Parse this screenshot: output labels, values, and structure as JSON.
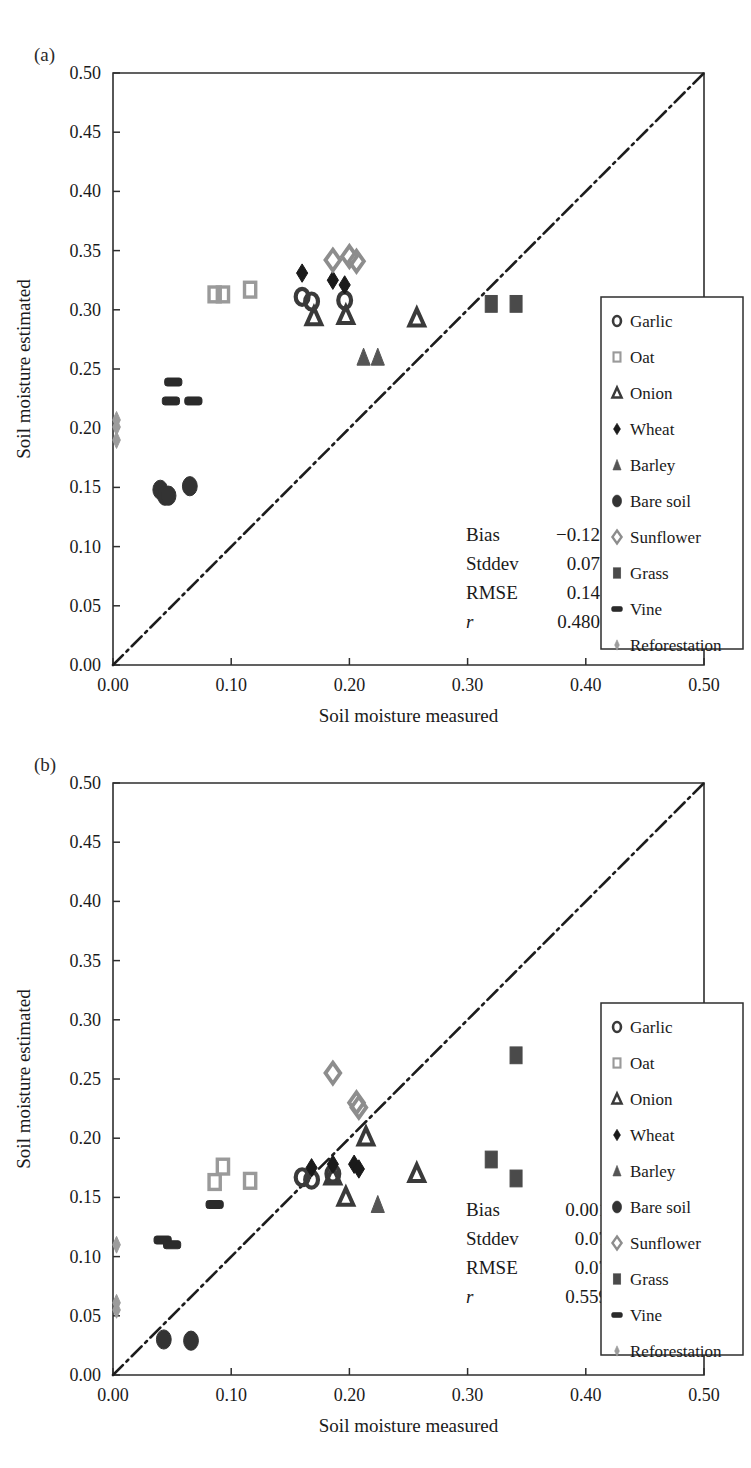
{
  "figure": {
    "panels": [
      {
        "tag": "(a)",
        "stats": {
          "rows": [
            {
              "label": "Bias",
              "value": "−0.12"
            },
            {
              "label": "Stddev",
              "value": "0.07"
            },
            {
              "label": "RMSE",
              "value": "0.14"
            },
            {
              "label": "r",
              "value": "0.480"
            }
          ]
        }
      },
      {
        "tag": "(b)",
        "stats": {
          "rows": [
            {
              "label": "Bias",
              "value": "0.001"
            },
            {
              "label": "Stddev",
              "value": "0.07"
            },
            {
              "label": "RMSE",
              "value": "0.07"
            },
            {
              "label": "r",
              "value": "0.559"
            }
          ]
        }
      }
    ],
    "legend": {
      "entries": [
        {
          "label": "Garlic",
          "marker": "circle-open",
          "color": "#3a3a3a"
        },
        {
          "label": "Oat",
          "marker": "square-open",
          "color": "#9a9a9a"
        },
        {
          "label": "Onion",
          "marker": "triangle-open",
          "color": "#3a3a3a"
        },
        {
          "label": "Wheat",
          "marker": "diamond-solid",
          "color": "#1a1a1a"
        },
        {
          "label": "Barley",
          "marker": "triangle-solid",
          "color": "#555555"
        },
        {
          "label": "Bare soil",
          "marker": "ellipse-solid",
          "color": "#333333"
        },
        {
          "label": "Sunflower",
          "marker": "diamond-open",
          "color": "#8d8d8d"
        },
        {
          "label": "Grass",
          "marker": "square-solid",
          "color": "#4a4a4a"
        },
        {
          "label": "Vine",
          "marker": "bar-solid",
          "color": "#2b2b2b"
        },
        {
          "label": "Reforestation",
          "marker": "diamond-small",
          "color": "#9c9c9c"
        }
      ]
    }
  },
  "chart_data": [
    {
      "type": "scatter",
      "title": "(a)",
      "xlabel": "Soil moisture measured",
      "ylabel": "Soil moisture estimated",
      "xlim": [
        0.0,
        0.5
      ],
      "ylim": [
        0.0,
        0.5
      ],
      "xticks": [
        "0.00",
        "0.10",
        "0.20",
        "0.30",
        "0.40",
        "0.50"
      ],
      "yticks": [
        "0.00",
        "0.05",
        "0.10",
        "0.15",
        "0.20",
        "0.25",
        "0.30",
        "0.35",
        "0.40",
        "0.45",
        "0.50"
      ],
      "grid": false,
      "legend_position": "right-middle",
      "reference_line": {
        "label": "1:1 line",
        "from": [
          0.0,
          0.0
        ],
        "to": [
          0.5,
          0.5
        ],
        "style": "dash-dot"
      },
      "annotations": [
        {
          "label": "Bias",
          "value": "−0.12"
        },
        {
          "label": "Stddev",
          "value": "0.07"
        },
        {
          "label": "RMSE",
          "value": "0.14"
        },
        {
          "label": "r",
          "value": "0.480"
        }
      ],
      "series": [
        {
          "name": "Garlic",
          "marker": "circle-open",
          "points": [
            [
              0.16,
              0.311
            ],
            [
              0.168,
              0.307
            ],
            [
              0.196,
              0.308
            ]
          ]
        },
        {
          "name": "Oat",
          "marker": "square-open",
          "points": [
            [
              0.086,
              0.313
            ],
            [
              0.093,
              0.313
            ],
            [
              0.116,
              0.317
            ]
          ]
        },
        {
          "name": "Onion",
          "marker": "triangle-open",
          "points": [
            [
              0.17,
              0.294
            ],
            [
              0.197,
              0.295
            ],
            [
              0.257,
              0.293
            ]
          ]
        },
        {
          "name": "Wheat",
          "marker": "diamond-solid",
          "points": [
            [
              0.16,
              0.331
            ],
            [
              0.186,
              0.325
            ],
            [
              0.196,
              0.321
            ]
          ]
        },
        {
          "name": "Barley",
          "marker": "triangle-solid",
          "points": [
            [
              0.212,
              0.26
            ],
            [
              0.224,
              0.26
            ]
          ]
        },
        {
          "name": "Bare soil",
          "marker": "ellipse-solid",
          "points": [
            [
              0.04,
              0.148
            ],
            [
              0.044,
              0.143
            ],
            [
              0.047,
              0.143
            ],
            [
              0.065,
              0.151
            ]
          ]
        },
        {
          "name": "Sunflower",
          "marker": "diamond-open",
          "points": [
            [
              0.186,
              0.342
            ],
            [
              0.2,
              0.345
            ],
            [
              0.206,
              0.341
            ]
          ]
        },
        {
          "name": "Grass",
          "marker": "square-solid",
          "points": [
            [
              0.32,
              0.305
            ],
            [
              0.341,
              0.305
            ]
          ]
        },
        {
          "name": "Vine",
          "marker": "bar-solid",
          "points": [
            [
              0.051,
              0.239
            ],
            [
              0.049,
              0.223
            ],
            [
              0.068,
              0.223
            ]
          ]
        },
        {
          "name": "Reforestation",
          "marker": "diamond-small",
          "points": [
            [
              0.003,
              0.207
            ],
            [
              0.003,
              0.201
            ],
            [
              0.003,
              0.19
            ]
          ]
        }
      ]
    },
    {
      "type": "scatter",
      "title": "(b)",
      "xlabel": "Soil moisture measured",
      "ylabel": "Soil moisture estimated",
      "xlim": [
        0.0,
        0.5
      ],
      "ylim": [
        0.0,
        0.5
      ],
      "xticks": [
        "0.00",
        "0.10",
        "0.20",
        "0.30",
        "0.40",
        "0.50"
      ],
      "yticks": [
        "0.00",
        "0.05",
        "0.10",
        "0.15",
        "0.20",
        "0.25",
        "0.30",
        "0.35",
        "0.40",
        "0.45",
        "0.50"
      ],
      "grid": false,
      "legend_position": "right-middle",
      "reference_line": {
        "label": "1:1 line",
        "from": [
          0.0,
          0.0
        ],
        "to": [
          0.5,
          0.5
        ],
        "style": "dash-dot"
      },
      "annotations": [
        {
          "label": "Bias",
          "value": "0.001"
        },
        {
          "label": "Stddev",
          "value": "0.07"
        },
        {
          "label": "RMSE",
          "value": "0.07"
        },
        {
          "label": "r",
          "value": "0.559"
        }
      ],
      "series": [
        {
          "name": "Garlic",
          "marker": "circle-open",
          "points": [
            [
              0.16,
              0.167
            ],
            [
              0.168,
              0.165
            ],
            [
              0.186,
              0.17
            ]
          ]
        },
        {
          "name": "Oat",
          "marker": "square-open",
          "points": [
            [
              0.086,
              0.163
            ],
            [
              0.093,
              0.176
            ],
            [
              0.116,
              0.164
            ]
          ]
        },
        {
          "name": "Onion",
          "marker": "triangle-open",
          "points": [
            [
              0.186,
              0.168
            ],
            [
              0.197,
              0.15
            ],
            [
              0.214,
              0.201
            ],
            [
              0.257,
              0.17
            ]
          ]
        },
        {
          "name": "Wheat",
          "marker": "diamond-solid",
          "points": [
            [
              0.168,
              0.175
            ],
            [
              0.186,
              0.178
            ],
            [
              0.204,
              0.178
            ],
            [
              0.208,
              0.174
            ]
          ]
        },
        {
          "name": "Barley",
          "marker": "triangle-solid",
          "points": [
            [
              0.224,
              0.144
            ]
          ]
        },
        {
          "name": "Bare soil",
          "marker": "ellipse-solid",
          "points": [
            [
              0.043,
              0.03
            ],
            [
              0.066,
              0.029
            ]
          ]
        },
        {
          "name": "Sunflower",
          "marker": "diamond-open",
          "points": [
            [
              0.186,
              0.255
            ],
            [
              0.206,
              0.23
            ],
            [
              0.208,
              0.226
            ]
          ]
        },
        {
          "name": "Grass",
          "marker": "square-solid",
          "points": [
            [
              0.32,
              0.182
            ],
            [
              0.341,
              0.27
            ],
            [
              0.341,
              0.166
            ]
          ]
        },
        {
          "name": "Vine",
          "marker": "bar-solid",
          "points": [
            [
              0.042,
              0.114
            ],
            [
              0.05,
              0.11
            ],
            [
              0.086,
              0.144
            ]
          ]
        },
        {
          "name": "Reforestation",
          "marker": "diamond-small",
          "points": [
            [
              0.003,
              0.11
            ],
            [
              0.003,
              0.061
            ],
            [
              0.003,
              0.055
            ]
          ]
        }
      ]
    }
  ]
}
